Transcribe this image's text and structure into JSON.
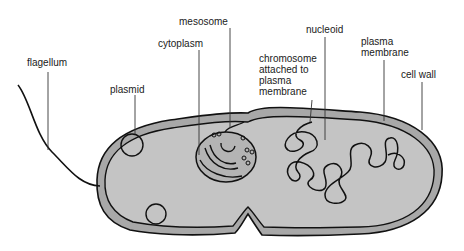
{
  "diagram": {
    "labels": {
      "flagellum": "flagellum",
      "plasmid": "plasmid",
      "cytoplasm": "cytoplasm",
      "mesosome": "mesosome",
      "chromosome": "chromosome\nattached to\nplasma\nmembrane",
      "nucleoid": "nucleoid",
      "plasma_membrane": "plasma\nmembrane",
      "cell_wall": "cell wall"
    },
    "colors": {
      "cell_wall_fill": "#a8a8a8",
      "cytoplasm_fill": "#c4c4c4",
      "outline": "#111111",
      "leader_line": "#333333",
      "background": "#ffffff"
    }
  }
}
